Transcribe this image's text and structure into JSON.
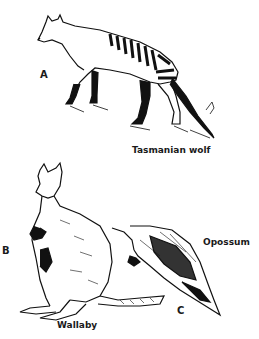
{
  "figure": {
    "panels": [
      {
        "letter": "A",
        "name": "Tasmanian wolf"
      },
      {
        "letter": "B",
        "name": "Wallaby"
      },
      {
        "letter": "C",
        "name": "Opossum"
      }
    ]
  }
}
